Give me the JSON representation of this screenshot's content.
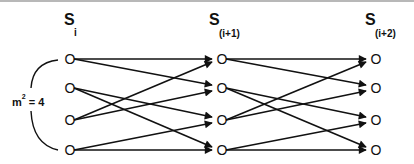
{
  "diagram": {
    "stages": [
      {
        "symbol": "S",
        "subscript": "i",
        "x": 70
      },
      {
        "symbol": "S",
        "subscript": "(i+1)",
        "x": 222
      },
      {
        "symbol": "S",
        "subscript": "(i+2)",
        "x": 376
      }
    ],
    "node_rows_y": [
      59,
      88,
      120,
      150
    ],
    "node_glyph": "O",
    "group_label": {
      "base": "m",
      "exponent": "2",
      "rest": " = 4"
    },
    "edges_per_stage": [
      {
        "from": 1,
        "to": 1
      },
      {
        "from": 1,
        "to": 2
      },
      {
        "from": 2,
        "to": 3
      },
      {
        "from": 2,
        "to": 4
      },
      {
        "from": 3,
        "to": 1
      },
      {
        "from": 3,
        "to": 2
      },
      {
        "from": 4,
        "to": 3
      },
      {
        "from": 4,
        "to": 4
      }
    ],
    "colors": {
      "ink": "#111111",
      "rule": "#b8b8b8",
      "background": "#ffffff"
    }
  }
}
